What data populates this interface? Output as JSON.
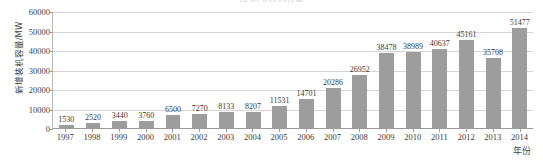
{
  "chart_data": {
    "type": "bar",
    "title": "",
    "xlabel": "年份",
    "ylabel": "新增装机容量/MW",
    "categories": [
      "1997",
      "1998",
      "1999",
      "2000",
      "2001",
      "2002",
      "2003",
      "2004",
      "2005",
      "2006",
      "2007",
      "2008",
      "2009",
      "2010",
      "2011",
      "2012",
      "2013",
      "2014"
    ],
    "values": [
      1530,
      2520,
      3440,
      3760,
      6500,
      7270,
      8133,
      8207,
      11531,
      14701,
      20286,
      26952,
      38478,
      38989,
      40637,
      45161,
      35708,
      51477
    ],
    "ylim": [
      0,
      60000
    ],
    "yticks": [
      0,
      10000,
      20000,
      30000,
      40000,
      50000,
      60000
    ],
    "ytick_labels": [
      "0",
      "10000",
      "20000",
      "30000",
      "40000",
      "50000",
      "60000"
    ],
    "grid": true,
    "legend": "none",
    "data_labels": true,
    "series_color": "#9d9d9d"
  },
  "axes": {
    "y_title": "新增装机容量/MW",
    "x_title": "年份"
  },
  "title_sliver": "图 新增装机容量"
}
